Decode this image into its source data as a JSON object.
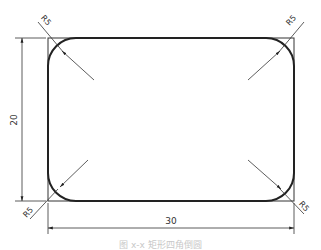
{
  "figure": {
    "dimensions": {
      "width_label": "30",
      "height_label": "20",
      "radius_labels": [
        "R5",
        "R5",
        "R5",
        "R5"
      ]
    },
    "caption": "图 x-x 矩形四角倒圆"
  },
  "colors": {
    "line": "#222222",
    "thin_line": "#333333",
    "background": "#ffffff"
  }
}
